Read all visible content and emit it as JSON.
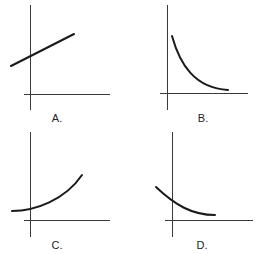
{
  "panels": [
    {
      "id": "A",
      "label": "A.",
      "description": "Straight line with positive slope, positive y-intercept",
      "axes": {
        "y_x": 30,
        "y_top": 5,
        "y_bottom": 110,
        "x_y": 94,
        "x_left": 24,
        "x_right": 110
      },
      "path": "M11,66 L74,34",
      "label_pos": [
        57,
        122
      ]
    },
    {
      "id": "B",
      "label": "B.",
      "description": "Decreasing convex curve (exponential decay) approaching x-axis",
      "axes": {
        "y_x": 167,
        "y_top": 5,
        "y_bottom": 110,
        "x_y": 93,
        "x_left": 160,
        "x_right": 248
      },
      "path": "M172,36 C180,65 195,88 228,90",
      "label_pos": [
        203,
        122
      ]
    },
    {
      "id": "C",
      "label": "C.",
      "description": "Increasing convex curve (exponential growth) with positive y-intercept",
      "axes": {
        "y_x": 30,
        "y_top": 132,
        "y_bottom": 237,
        "x_y": 220,
        "x_left": 24,
        "x_right": 110
      },
      "path": "M12,211 C35,211 65,200 82,175",
      "label_pos": [
        57,
        249
      ]
    },
    {
      "id": "D",
      "label": "D.",
      "description": "Decreasing convex curve crossing y-axis, leveling off above x-axis",
      "axes": {
        "y_x": 172,
        "y_top": 132,
        "y_bottom": 237,
        "x_y": 220,
        "x_left": 165,
        "x_right": 253
      },
      "path": "M156,187 C175,205 192,215 215,215",
      "label_pos": [
        202,
        249
      ]
    }
  ],
  "colors": {
    "axis": "#3a3a3a",
    "curve": "#1a1a1a",
    "background": "#ffffff"
  }
}
